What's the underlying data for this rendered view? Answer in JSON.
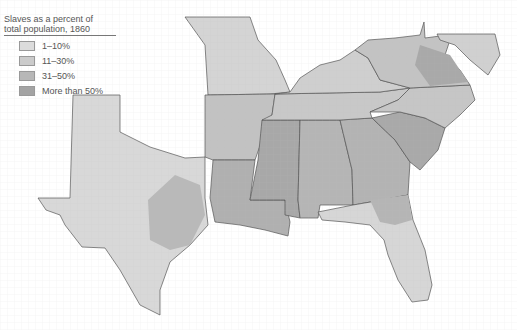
{
  "legend": {
    "title_line1": "Slaves as a percent of",
    "title_line2": "total population, 1860",
    "items": [
      {
        "label": "1–10%",
        "color": "#dcdcdc"
      },
      {
        "label": "11–30%",
        "color": "#cbcbcb"
      },
      {
        "label": "31–50%",
        "color": "#b7b7b7"
      },
      {
        "label": "More than 50%",
        "color": "#a3a3a3"
      }
    ]
  },
  "map": {
    "region": "Southern United States",
    "year": "1860",
    "border_color": "#555555"
  }
}
